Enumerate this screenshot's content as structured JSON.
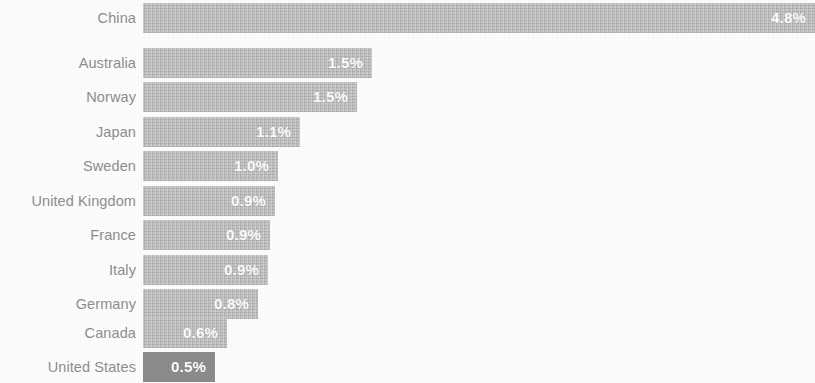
{
  "chart_data": {
    "type": "bar",
    "orientation": "horizontal",
    "title": "",
    "subtitle": "",
    "xlabel": "",
    "ylabel": "",
    "grid": false,
    "legend": "none",
    "axis_visible": false,
    "tick_labels_visible": false,
    "value_label_suffix": "%",
    "xlim": [
      0,
      5.0
    ],
    "categories": [
      "China",
      "Australia",
      "Norway",
      "Japan",
      "Sweden",
      "United Kingdom",
      "France",
      "Italy",
      "Germany",
      "Canada",
      "United States"
    ],
    "values": [
      4.8,
      1.5,
      1.5,
      1.1,
      1.0,
      0.9,
      0.9,
      0.9,
      0.8,
      0.6,
      0.5
    ],
    "value_labels": [
      "4.8%",
      "1.5%",
      "1.5%",
      "1.1%",
      "1.0%",
      "0.9%",
      "0.9%",
      "0.9%",
      "0.8%",
      "0.6%",
      "0.5%"
    ],
    "highlighted_category": "United States",
    "colors": {
      "bar": "#bcbcbc",
      "bar_highlight": "#8c8c8c",
      "value_label": "#ffffff",
      "category_label": "#8e8e8e",
      "background": "#fdfdfd"
    },
    "bars": [
      {
        "label": "China",
        "value": 4.8,
        "value_label": "4.8%",
        "bar_width": 672,
        "top": 3,
        "highlight": false
      },
      {
        "label": "Australia",
        "value": 1.5,
        "value_label": "1.5%",
        "bar_width": 229,
        "top": 48,
        "highlight": false
      },
      {
        "label": "Norway",
        "value": 1.5,
        "value_label": "1.5%",
        "bar_width": 214,
        "top": 82,
        "highlight": false
      },
      {
        "label": "Japan",
        "value": 1.1,
        "value_label": "1.1%",
        "bar_width": 157,
        "top": 117,
        "highlight": false
      },
      {
        "label": "Sweden",
        "value": 1.0,
        "value_label": "1.0%",
        "bar_width": 135,
        "top": 151,
        "highlight": false
      },
      {
        "label": "United Kingdom",
        "value": 0.9,
        "value_label": "0.9%",
        "bar_width": 132,
        "top": 186,
        "highlight": false
      },
      {
        "label": "France",
        "value": 0.9,
        "value_label": "0.9%",
        "bar_width": 127,
        "top": 220,
        "highlight": false
      },
      {
        "label": "Italy",
        "value": 0.9,
        "value_label": "0.9%",
        "bar_width": 125,
        "top": 255,
        "highlight": false
      },
      {
        "label": "Germany",
        "value": 0.8,
        "value_label": "0.8%",
        "bar_width": 115,
        "top": 289,
        "highlight": false
      },
      {
        "label": "Canada",
        "value": 0.6,
        "value_label": "0.6%",
        "bar_width": 84,
        "top": 318,
        "highlight": false
      },
      {
        "label": "United States",
        "value": 0.5,
        "value_label": "0.5%",
        "bar_width": 72,
        "top": 352,
        "highlight": true
      }
    ]
  }
}
